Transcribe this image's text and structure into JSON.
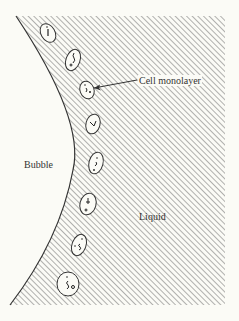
{
  "diagram": {
    "labels": {
      "bubble": "Bubble",
      "liquid": "Liquid",
      "cell_monolayer": "Cell monolayer"
    },
    "colors": {
      "background": "#fbfbf6",
      "hatch": "#555555",
      "outline": "#333333"
    },
    "cells": [
      {
        "cx": 48,
        "cy": 33,
        "rx": 7,
        "ry": 10
      },
      {
        "cx": 73,
        "cy": 60,
        "rx": 7,
        "ry": 11
      },
      {
        "cx": 87,
        "cy": 90,
        "rx": 7,
        "ry": 9
      },
      {
        "cx": 93,
        "cy": 124,
        "rx": 7,
        "ry": 10
      },
      {
        "cx": 96,
        "cy": 163,
        "rx": 7,
        "ry": 11
      },
      {
        "cx": 88,
        "cy": 204,
        "rx": 8,
        "ry": 11
      },
      {
        "cx": 79,
        "cy": 245,
        "rx": 7,
        "ry": 11
      },
      {
        "cx": 68,
        "cy": 284,
        "rx": 11,
        "ry": 12
      }
    ]
  }
}
